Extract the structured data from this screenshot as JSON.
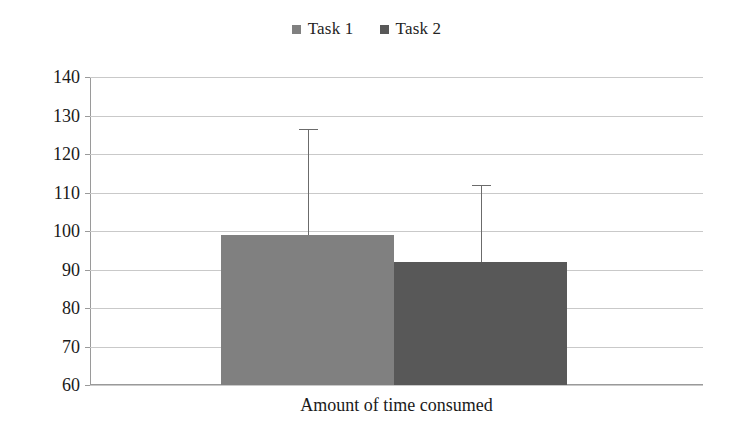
{
  "chart_data": {
    "type": "bar",
    "title": "",
    "subtitle": "",
    "xlabel": "Amount of time consumed",
    "ylabel": "",
    "categories": [
      "Amount of time consumed"
    ],
    "ylim": [
      60,
      140
    ],
    "ytick_step": 10,
    "ytick_labels": [
      "140",
      "130",
      "120",
      "110",
      "100",
      "90",
      "80",
      "70",
      "60"
    ],
    "ytick_values": [
      140,
      130,
      120,
      110,
      100,
      90,
      80,
      70,
      60
    ],
    "grid": true,
    "legend_position": "top-center",
    "series": [
      {
        "name": "Task 1",
        "values": [
          99
        ],
        "color": "#808080",
        "error_upper": [
          126.5
        ],
        "error_bar": "upper-only-with-cap"
      },
      {
        "name": "Task 2",
        "values": [
          92
        ],
        "color": "#585858",
        "error_upper": [
          112
        ],
        "error_bar": "upper-only-with-cap"
      }
    ],
    "annotations": []
  },
  "legend": {
    "entries": [
      {
        "label": "Task 1",
        "marker": "square-marker",
        "color": "#808080"
      },
      {
        "label": "Task 2",
        "marker": "square-marker",
        "color": "#585858"
      }
    ]
  },
  "axes": {
    "x_title": "Amount of time consumed",
    "y_labels": [
      "140",
      "130",
      "120",
      "110",
      "100",
      "90",
      "80",
      "70",
      "60"
    ]
  }
}
